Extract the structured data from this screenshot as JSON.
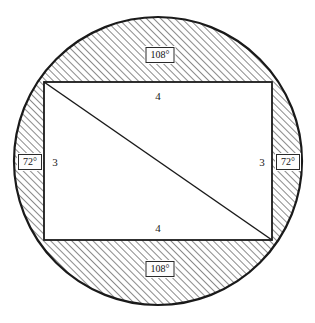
{
  "figure": {
    "shapes": {
      "circle": {
        "name": "circumscribed-circle",
        "cx": 158,
        "cy": 161,
        "r": 144,
        "stroke": "#1a1a1a",
        "fill": "#ffffff"
      },
      "rectangle": {
        "name": "inscribed-rectangle",
        "x": 44,
        "y": 82,
        "width": 228,
        "height": 158,
        "stroke": "#1a1a1a",
        "fill": "#ffffff"
      },
      "diagonal": {
        "name": "rectangle-diagonal",
        "x1": 44,
        "y1": 82,
        "x2": 272,
        "y2": 240,
        "stroke": "#1a1a1a"
      }
    },
    "hatching": {
      "angle_deg": 45,
      "color": "#2b2b2b",
      "spacing": 5,
      "line_width": 1.1
    },
    "labels": [
      {
        "id": "top-side-length",
        "text": "4",
        "x": 158,
        "y": 96,
        "type": "plain"
      },
      {
        "id": "bottom-side-length",
        "text": "4",
        "x": 158,
        "y": 228,
        "type": "plain"
      },
      {
        "id": "left-side-length",
        "text": "3",
        "x": 55,
        "y": 162,
        "type": "plain"
      },
      {
        "id": "right-side-length",
        "text": "3",
        "x": 262,
        "y": 162,
        "type": "plain"
      },
      {
        "id": "top-arc-angle",
        "text": "108°",
        "x": 160,
        "y": 55,
        "type": "boxed"
      },
      {
        "id": "bottom-arc-angle",
        "text": "108°",
        "x": 160,
        "y": 269,
        "type": "boxed"
      },
      {
        "id": "left-arc-angle",
        "text": "72°",
        "x": 30,
        "y": 162,
        "type": "boxed"
      },
      {
        "id": "right-arc-angle",
        "text": "72°",
        "x": 288,
        "y": 162,
        "type": "boxed"
      }
    ]
  }
}
